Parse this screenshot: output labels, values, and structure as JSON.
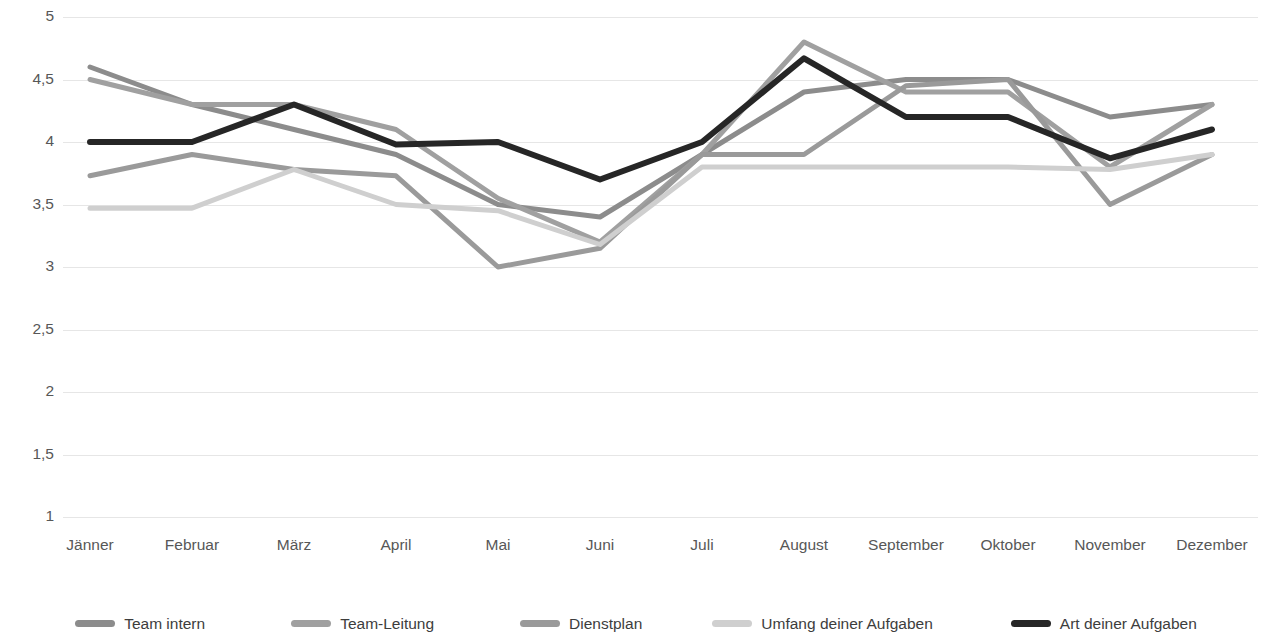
{
  "chart_data": {
    "type": "line",
    "title": "",
    "subtitle": "",
    "xlabel": "",
    "ylabel": "",
    "categories": [
      "Jänner",
      "Februar",
      "März",
      "April",
      "Mai",
      "Juni",
      "Juli",
      "August",
      "September",
      "Oktober",
      "November",
      "Dezember"
    ],
    "ylim": [
      1,
      5
    ],
    "yticks": [
      1,
      1.5,
      2,
      2.5,
      3,
      3.5,
      4,
      4.5,
      5
    ],
    "ytick_labels": [
      "1",
      "1,5",
      "2",
      "2,5",
      "3",
      "3,5",
      "4",
      "4,5",
      "5"
    ],
    "grid": true,
    "legend_position": "bottom",
    "series": [
      {
        "name": "Team intern",
        "color": "#8c8c8c",
        "values": [
          4.6,
          4.3,
          4.1,
          3.9,
          3.5,
          3.4,
          3.9,
          4.4,
          4.5,
          4.5,
          4.2,
          4.3
        ]
      },
      {
        "name": "Team-Leitung",
        "color": "#a0a0a0",
        "values": [
          4.5,
          4.3,
          4.3,
          4.1,
          3.55,
          3.2,
          3.9,
          4.8,
          4.4,
          4.4,
          3.8,
          4.3
        ]
      },
      {
        "name": "Dienstplan",
        "color": "#9a9a9a",
        "values": [
          3.73,
          3.9,
          3.78,
          3.73,
          3.0,
          3.15,
          3.9,
          3.9,
          4.45,
          4.5,
          3.5,
          3.9
        ]
      },
      {
        "name": "Umfang deiner Aufgaben",
        "color": "#cfcfcf",
        "values": [
          3.47,
          3.47,
          3.78,
          3.5,
          3.45,
          3.18,
          3.8,
          3.8,
          3.8,
          3.8,
          3.78,
          3.9
        ]
      },
      {
        "name": "Art deiner Aufgaben",
        "color": "#262626",
        "values": [
          4.0,
          4.0,
          4.3,
          3.98,
          4.0,
          3.7,
          4.0,
          4.67,
          4.2,
          4.2,
          3.87,
          4.1
        ]
      }
    ]
  },
  "axis": {
    "y_tick_labels": [
      "5",
      "4,5",
      "4",
      "3,5",
      "3",
      "2,5",
      "2",
      "1,5",
      "1"
    ],
    "x_tick_labels": [
      "Jänner",
      "Februar",
      "März",
      "April",
      "Mai",
      "Juni",
      "Juli",
      "August",
      "September",
      "Oktober",
      "November",
      "Dezember"
    ]
  },
  "legend": {
    "items": [
      {
        "label": "Team intern",
        "color": "#8c8c8c"
      },
      {
        "label": "Team-Leitung",
        "color": "#a0a0a0"
      },
      {
        "label": "Dienstplan",
        "color": "#9a9a9a"
      },
      {
        "label": "Umfang deiner Aufgaben",
        "color": "#cfcfcf"
      },
      {
        "label": "Art deiner Aufgaben",
        "color": "#262626"
      }
    ]
  }
}
